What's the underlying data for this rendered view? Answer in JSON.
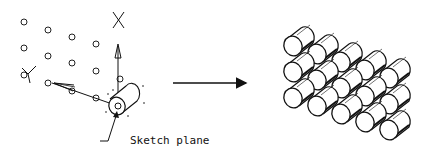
{
  "figure": {
    "left_panel": {
      "axis_x_label": "X",
      "axis_y_label": "Y",
      "annotation": "Sketch plane",
      "points": [
        [
          24,
          22
        ],
        [
          48,
          30
        ],
        [
          72,
          37
        ],
        [
          96,
          44
        ],
        [
          24,
          48
        ],
        [
          48,
          56
        ],
        [
          72,
          63
        ],
        [
          96,
          71
        ],
        [
          24,
          75
        ],
        [
          48,
          83
        ],
        [
          72,
          91
        ],
        [
          96,
          98
        ],
        [
          120,
          79
        ]
      ]
    },
    "transition_arrow": "right-arrow",
    "right_panel": {
      "description": "Rectangular pattern array of cylinders",
      "rows": 3,
      "columns": 5
    },
    "colors": {
      "stroke": "#111111",
      "background": "#ffffff"
    }
  }
}
